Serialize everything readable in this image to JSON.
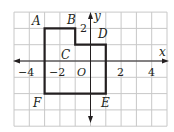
{
  "figure": {
    "type": "coordinate-grid-polygon",
    "grid": {
      "x_min": -5,
      "x_max": 5,
      "y_min": -4,
      "y_max": 3,
      "pixel_origin": [
        90.5,
        61
      ],
      "unit_px_x": 15.3,
      "unit_px_y": 16.3,
      "grid_color": "#c8c8c8",
      "axis_color": "#231f20"
    },
    "axes": {
      "x_label": "x",
      "y_label": "y",
      "origin_label": "O",
      "x_ticks": [
        {
          "value": -4,
          "label": "−4"
        },
        {
          "value": -2,
          "label": "−2"
        },
        {
          "value": 2,
          "label": "2"
        },
        {
          "value": 4,
          "label": "4"
        }
      ],
      "y_ticks": [
        {
          "value": 2,
          "label": "2"
        }
      ]
    },
    "polygon": {
      "stroke_color": "#231f20",
      "vertices": [
        {
          "name": "A",
          "x": -3,
          "y": 2
        },
        {
          "name": "B",
          "x": -1,
          "y": 2
        },
        {
          "name": "C",
          "x": -1,
          "y": 1
        },
        {
          "name": "D",
          "x": 1,
          "y": 1
        },
        {
          "name": "E",
          "x": 1,
          "y": -2
        },
        {
          "name": "F",
          "x": -3,
          "y": -2
        }
      ]
    },
    "labels": {
      "A": "A",
      "B": "B",
      "C": "C",
      "D": "D",
      "E": "E",
      "F": "F"
    }
  }
}
